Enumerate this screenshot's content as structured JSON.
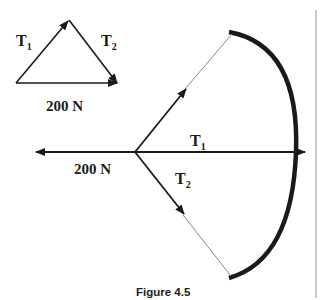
{
  "figure": {
    "caption": "Figure 4.5",
    "triangle": {
      "t1_label": "T",
      "t1_sub": "1",
      "t2_label": "T",
      "t2_sub": "2",
      "base_label": "200 N"
    },
    "bow": {
      "t1_label": "T",
      "t1_sub": "1",
      "t2_label": "T",
      "t2_sub": "2",
      "force_label": "200 N"
    },
    "colors": {
      "ink": "#1a1a1a",
      "string": "#888888",
      "divider": "#999999"
    }
  }
}
